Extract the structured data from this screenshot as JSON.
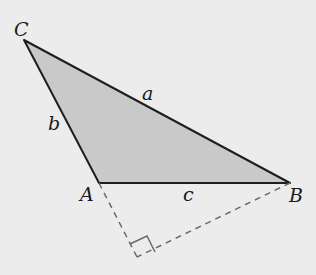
{
  "figure": {
    "background_color": "#ececec",
    "fill_color": "#c9c9c9",
    "stroke_color": "#1e1e1e",
    "dashed_color": "#6a6a6a",
    "vertices": {
      "A": {
        "label": "A",
        "x": 99,
        "y": 183
      },
      "B": {
        "label": "B",
        "x": 290,
        "y": 183
      },
      "C": {
        "label": "C",
        "x": 24,
        "y": 40
      }
    },
    "sides": {
      "a": {
        "label": "a",
        "between": "B-C"
      },
      "b": {
        "label": "b",
        "between": "A-C"
      },
      "c": {
        "label": "c",
        "between": "A-B"
      }
    },
    "altitude_foot": {
      "x": 137,
      "y": 257,
      "right_angle_marker": true
    }
  }
}
